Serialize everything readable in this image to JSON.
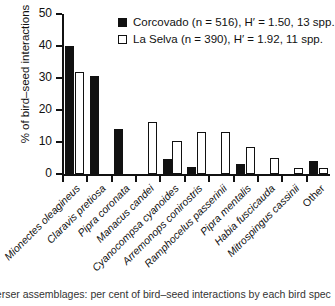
{
  "chart_data": {
    "type": "bar",
    "title": "",
    "xlabel": "",
    "ylabel": "% of bird–seed interactions",
    "ylim": [
      0,
      50
    ],
    "yticks": [
      0,
      10,
      20,
      30,
      40,
      50
    ],
    "grid": false,
    "legend_position": "top-right",
    "categories": [
      "Mionectes oleagineus",
      "Claravis pretiosa",
      "Pipra coronata",
      "Manacus candei",
      "Cyanocompsa cyanoides",
      "Arremonops conirostris",
      "Ramphocelus passerinii",
      "Pipra mentalis",
      "Habia fuscicauda",
      "Mitrospingus cassinii",
      "Other"
    ],
    "series": [
      {
        "name": "Corcovado",
        "style": "solid-black",
        "values": [
          40.0,
          30.5,
          14.0,
          0,
          4.7,
          2.2,
          0,
          3.0,
          0,
          0,
          4.0
        ]
      },
      {
        "name": "La Selva",
        "style": "open-white",
        "values": [
          32.0,
          0,
          0,
          16.2,
          10.2,
          13.0,
          13.0,
          8.3,
          5.0,
          2.0,
          2.0
        ]
      }
    ]
  },
  "legend": {
    "entries": [
      {
        "swatch": "solid",
        "site": "Corcovado",
        "n_label": "(n = 516),",
        "h_label": "H′ = 1.50, 13 spp.",
        "full": "Corcovado (n = 516), H′ = 1.50, 13 spp."
      },
      {
        "swatch": "open",
        "site": "La Selva",
        "n_label": "(n = 390),",
        "h_label": "H′ = 1.92, 11 spp.",
        "full": "La Selva (n = 390), H′ = 1.92, 11 spp."
      }
    ]
  },
  "axes": {
    "y_title": "% of bird–seed interactions",
    "y_tick_labels": [
      "0",
      "10",
      "20",
      "30",
      "40",
      "50"
    ]
  },
  "caption": {
    "text": "perser assemblages: per cent of bird–seed interactions by each bird spec"
  },
  "colors": {
    "ink": "#111111",
    "paper": "#ffffff"
  }
}
